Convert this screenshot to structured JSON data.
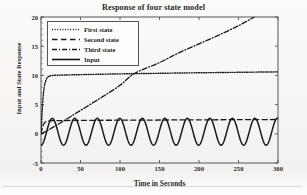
{
  "chart_data": {
    "type": "line",
    "title": "Response of four state model",
    "xlabel": "Time in Seconds",
    "ylabel": "Input and State Response",
    "xlim": [
      0,
      300
    ],
    "ylim": [
      -5,
      20
    ],
    "xticks": [
      0,
      50,
      100,
      150,
      200,
      250,
      300
    ],
    "yticks": [
      -5,
      0,
      5,
      10,
      15,
      20
    ],
    "grid": false,
    "legend_position": "upper-left-inside",
    "series": [
      {
        "name": "First state",
        "style": "dotted",
        "color": "#1a1a1a",
        "description": "Fast first-order rise from 0 to about 10 within the first 10 seconds, then a very slow drift upward to about 10.6 at t=300.",
        "x": [
          0,
          2,
          4,
          6,
          8,
          10,
          14,
          20,
          30,
          50,
          75,
          100,
          125,
          150,
          175,
          200,
          225,
          250,
          275,
          300
        ],
        "y": [
          0.0,
          5.1,
          7.9,
          9.1,
          9.6,
          9.85,
          9.98,
          10.03,
          10.07,
          10.13,
          10.2,
          10.26,
          10.31,
          10.36,
          10.41,
          10.45,
          10.49,
          10.53,
          10.57,
          10.6
        ]
      },
      {
        "name": "Second state",
        "style": "dashed",
        "color": "#1a1a1a",
        "description": "Rises quickly from 0 to about 2.2 in the first few seconds then stays essentially flat, creeping to about 2.45 at t=300.",
        "x": [
          0,
          2,
          4,
          6,
          8,
          10,
          15,
          25,
          50,
          100,
          150,
          200,
          250,
          300
        ],
        "y": [
          0.0,
          1.2,
          1.8,
          2.05,
          2.15,
          2.2,
          2.24,
          2.27,
          2.3,
          2.33,
          2.36,
          2.39,
          2.42,
          2.45
        ]
      },
      {
        "name": "Third state",
        "style": "dash-dot",
        "color": "#1a1a1a",
        "description": "Ramps up almost linearly from 0, crossing the first state near t=118 at a value of about 10.3, and reaching the top of the axis (20) at about t=270 where it leaves the plot.",
        "x": [
          0,
          10,
          25,
          50,
          75,
          100,
          118,
          150,
          175,
          200,
          225,
          250,
          270
        ],
        "y": [
          0.0,
          0.7,
          1.9,
          4.0,
          6.1,
          8.3,
          10.3,
          12.2,
          13.9,
          15.4,
          16.9,
          18.5,
          20.0
        ]
      },
      {
        "name": "Input",
        "style": "solid",
        "color": "#111111",
        "description": "Sinusoidal input oscillating about a mean near 0.35 with amplitude about 2.3 and a period of roughly 28.5 seconds, giving about 10.5 cycles over the 300 second window.",
        "mean": 0.35,
        "amplitude": 2.3,
        "period": 28.5,
        "phase_deg": -90,
        "cycles": 10.5,
        "min": -1.95,
        "max": 2.65
      }
    ]
  },
  "legend": {
    "items": [
      {
        "label": "First state",
        "style": "dotted"
      },
      {
        "label": "Second state",
        "style": "dashed"
      },
      {
        "label": "Third state",
        "style": "dash-dot"
      },
      {
        "label": "Input",
        "style": "solid"
      }
    ]
  },
  "axes": {
    "x_tick_labels": [
      "0",
      "50",
      "100",
      "150",
      "200",
      "250",
      "300"
    ],
    "y_tick_labels": [
      "-5",
      "0",
      "5",
      "10",
      "15",
      "20"
    ]
  },
  "colors": {
    "ink": "#1a1a1a",
    "frame": "#57544f",
    "paper": "#f7f6f4"
  }
}
